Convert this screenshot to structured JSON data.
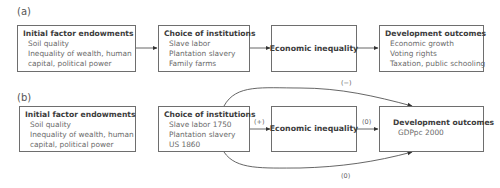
{
  "panels": [
    {
      "label": "(a)",
      "boxes": [
        {
          "title": "Initial factor endowments",
          "items": [
            "Soil quality",
            "Inequality of wealth, human",
            "capital, political power"
          ]
        },
        {
          "title": "Choice of institutions",
          "items": [
            "Slave labor",
            "Plantation slavery",
            "Family farms"
          ]
        },
        {
          "title": "Economic inequality",
          "items": []
        },
        {
          "title": "Development outcomes",
          "items": [
            "Economic growth",
            "Voting rights",
            "Taxation, public schooling"
          ]
        }
      ],
      "edges": [
        {
          "from": 0,
          "to": 1,
          "label": ""
        },
        {
          "from": 1,
          "to": 2,
          "label": ""
        },
        {
          "from": 2,
          "to": 3,
          "label": ""
        }
      ]
    },
    {
      "label": "(b)",
      "boxes": [
        {
          "title": "Initial factor endowments",
          "items": [
            "Soil quality",
            "Inequality of wealth, human",
            "capital, political power"
          ]
        },
        {
          "title": "Choice of institutions",
          "items": [
            "Slave labor 1750",
            "Plantation slavery",
            "US 1860"
          ]
        },
        {
          "title": "Economic inequality",
          "items": []
        },
        {
          "title": "Development outcomes",
          "items": [
            "GDPpc 2000"
          ]
        }
      ],
      "edges": [
        {
          "from": 1,
          "to": 2,
          "label": "(+)"
        },
        {
          "from": 2,
          "to": 3,
          "label": "(0)"
        },
        {
          "from": 1,
          "to": 3,
          "label": "(−)",
          "curve": "top"
        },
        {
          "from": 1,
          "to": 3,
          "label": "(0)",
          "curve": "bottom"
        }
      ]
    }
  ]
}
